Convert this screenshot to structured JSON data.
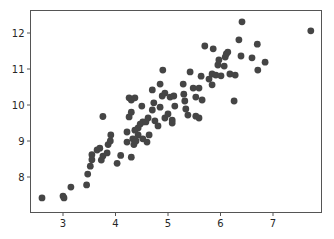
{
  "chart_data": {
    "type": "scatter",
    "title": "",
    "xlabel": "",
    "ylabel": "",
    "xlim": [
      2.35,
      7.9
    ],
    "ylim": [
      7.15,
      12.6
    ],
    "grid": false,
    "legend": null,
    "marker_color": "#454545",
    "x_ticks": [
      3,
      4,
      5,
      6,
      7
    ],
    "x_tick_labels": [
      "3",
      "4",
      "5",
      "6",
      "7"
    ],
    "y_ticks": [
      8,
      9,
      10,
      11,
      12
    ],
    "y_tick_labels": [
      "8",
      "9",
      "10",
      "11",
      "12"
    ],
    "series": [
      {
        "name": "points",
        "points": [
          [
            2.6,
            7.42
          ],
          [
            3.0,
            7.47
          ],
          [
            3.02,
            7.42
          ],
          [
            3.15,
            7.72
          ],
          [
            3.45,
            7.78
          ],
          [
            3.47,
            8.08
          ],
          [
            3.52,
            8.3
          ],
          [
            3.55,
            8.48
          ],
          [
            3.55,
            8.62
          ],
          [
            3.65,
            8.75
          ],
          [
            3.7,
            8.8
          ],
          [
            3.73,
            8.47
          ],
          [
            3.76,
            8.58
          ],
          [
            3.76,
            9.68
          ],
          [
            3.84,
            8.67
          ],
          [
            3.86,
            8.9
          ],
          [
            3.9,
            9.0
          ],
          [
            3.91,
            9.17
          ],
          [
            4.03,
            8.38
          ],
          [
            4.1,
            8.6
          ],
          [
            4.22,
            9.25
          ],
          [
            4.22,
            8.97
          ],
          [
            4.26,
            10.2
          ],
          [
            4.3,
            10.14
          ],
          [
            4.37,
            10.2
          ],
          [
            4.26,
            9.67
          ],
          [
            4.3,
            9.8
          ],
          [
            4.3,
            8.55
          ],
          [
            4.33,
            9.06
          ],
          [
            4.35,
            8.9
          ],
          [
            4.39,
            9.0
          ],
          [
            4.43,
            9.36
          ],
          [
            4.47,
            9.47
          ],
          [
            4.52,
            9.53
          ],
          [
            4.58,
            9.53
          ],
          [
            4.37,
            9.3
          ],
          [
            4.43,
            9.17
          ],
          [
            4.5,
            9.97
          ],
          [
            4.52,
            9.06
          ],
          [
            4.6,
            8.97
          ],
          [
            4.64,
            9.17
          ],
          [
            4.7,
            10.42
          ],
          [
            4.73,
            10.06
          ],
          [
            4.62,
            9.64
          ],
          [
            4.7,
            9.86
          ],
          [
            4.75,
            9.56
          ],
          [
            4.81,
            9.42
          ],
          [
            4.85,
            9.94
          ],
          [
            4.89,
            10.25
          ],
          [
            4.94,
            10.33
          ],
          [
            4.9,
            10.97
          ],
          [
            4.85,
            10.58
          ],
          [
            4.94,
            9.64
          ],
          [
            5.0,
            9.75
          ],
          [
            5.08,
            9.58
          ],
          [
            5.04,
            10.22
          ],
          [
            5.11,
            10.25
          ],
          [
            5.08,
            9.5
          ],
          [
            5.13,
            9.97
          ],
          [
            5.29,
            10.58
          ],
          [
            5.32,
            10.11
          ],
          [
            5.3,
            10.3
          ],
          [
            5.34,
            9.89
          ],
          [
            5.42,
            10.92
          ],
          [
            5.38,
            9.72
          ],
          [
            5.48,
            10.47
          ],
          [
            5.53,
            10.22
          ],
          [
            5.59,
            10.47
          ],
          [
            5.63,
            10.8
          ],
          [
            5.53,
            9.69
          ],
          [
            5.59,
            9.64
          ],
          [
            5.65,
            10.14
          ],
          [
            5.7,
            11.64
          ],
          [
            5.78,
            10.72
          ],
          [
            5.84,
            10.86
          ],
          [
            5.86,
            11.56
          ],
          [
            5.84,
            10.56
          ],
          [
            5.91,
            10.83
          ],
          [
            5.95,
            11.11
          ],
          [
            5.97,
            11.25
          ],
          [
            6.01,
            10.81
          ],
          [
            6.09,
            11.33
          ],
          [
            6.07,
            11.08
          ],
          [
            6.11,
            11.42
          ],
          [
            6.14,
            11.47
          ],
          [
            6.18,
            10.86
          ],
          [
            6.26,
            10.11
          ],
          [
            6.28,
            10.83
          ],
          [
            6.35,
            11.81
          ],
          [
            6.39,
            11.36
          ],
          [
            6.41,
            12.31
          ],
          [
            6.6,
            11.31
          ],
          [
            6.7,
            11.69
          ],
          [
            6.71,
            10.97
          ],
          [
            6.85,
            11.19
          ],
          [
            7.72,
            12.06
          ]
        ]
      }
    ]
  }
}
